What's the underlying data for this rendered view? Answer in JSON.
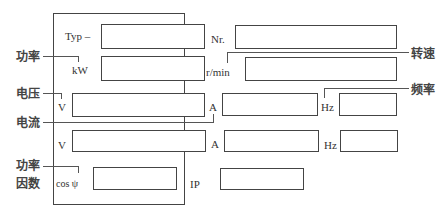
{
  "nameplate": {
    "type_label": "Typ –",
    "number_label": "Nr.",
    "power_unit": "kW",
    "speed_unit": "r/min",
    "voltage_unit_1": "V",
    "current_unit_1": "A",
    "freq_unit_1": "Hz",
    "voltage_unit_2": "V",
    "current_unit_2": "A",
    "freq_unit_2": "Hz",
    "cos_label": "cos ψ",
    "ip_label": "IP"
  },
  "annotations": {
    "power": "功率",
    "speed": "转速",
    "voltage": "电压",
    "frequency": "频率",
    "current": "电流",
    "power_factor_line1": "功率",
    "power_factor_line2": "因数"
  }
}
